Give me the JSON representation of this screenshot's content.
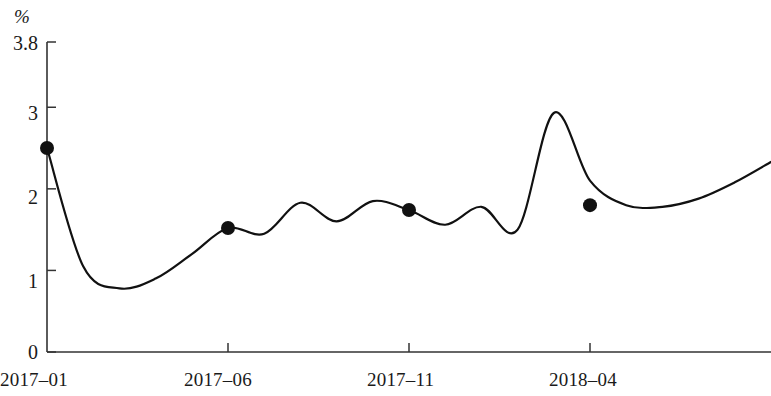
{
  "chart_data": {
    "type": "line",
    "title": "",
    "subtitle": "",
    "xlabel": "",
    "ylabel": "",
    "unit_label": "%",
    "grid": false,
    "legend": "none",
    "xlim": [
      0,
      20
    ],
    "ylim": [
      0,
      3.8
    ],
    "y_ticks": [
      {
        "value": 0,
        "label": "0"
      },
      {
        "value": 1,
        "label": "1"
      },
      {
        "value": 2,
        "label": "2"
      },
      {
        "value": 3,
        "label": "3"
      },
      {
        "value": 3.8,
        "label": "3.8"
      }
    ],
    "x_ticks": [
      {
        "value": 0,
        "label": "2017–01"
      },
      {
        "value": 5,
        "label": "2017–06"
      },
      {
        "value": 10,
        "label": "2017–11"
      },
      {
        "value": 15,
        "label": "2018–04"
      }
    ],
    "series": [
      {
        "name": "value",
        "color": "#111111",
        "x": [
          0,
          1,
          2,
          3,
          4,
          5,
          6,
          7,
          8,
          9,
          10,
          11,
          12,
          13,
          14,
          15,
          16,
          17,
          18,
          19,
          20
        ],
        "values": [
          2.5,
          1.05,
          0.78,
          0.9,
          1.2,
          1.52,
          1.45,
          1.83,
          1.6,
          1.85,
          1.74,
          1.56,
          1.78,
          1.5,
          2.93,
          2.1,
          1.8,
          1.78,
          1.88,
          2.08,
          2.33
        ]
      }
    ],
    "markers": [
      {
        "x": 0,
        "y": 2.5,
        "label": "2017–01"
      },
      {
        "x": 5,
        "y": 1.52,
        "label": "2017–06"
      },
      {
        "x": 10,
        "y": 1.74,
        "label": "2017–11"
      },
      {
        "x": 15,
        "y": 1.8,
        "label": "2018–04"
      }
    ],
    "marker_style": {
      "shape": "circle",
      "color": "#111111",
      "radius": 7
    },
    "annotations": []
  },
  "axes": {
    "line_color": "#333333",
    "y_axis_x_px": 47,
    "baseline_y_px": 352,
    "top_y_px": 42
  }
}
